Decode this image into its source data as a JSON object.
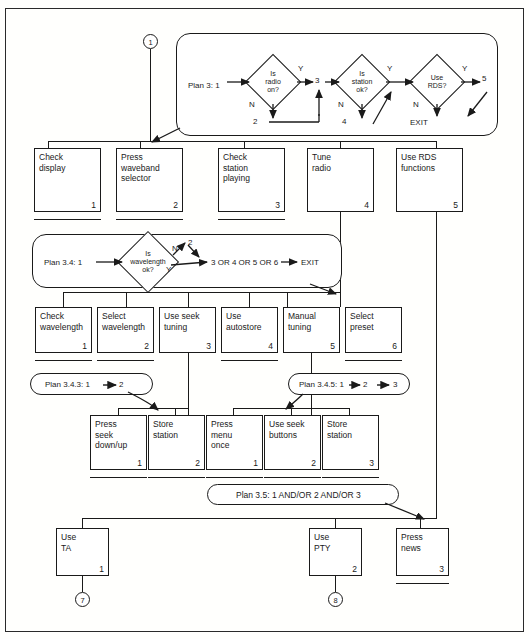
{
  "diagram": {
    "type": "hta-flow"
  },
  "connectors": {
    "top": "1",
    "bottom_left": "7",
    "bottom_right": "8"
  },
  "plan_3": {
    "label": "Plan 3: 1",
    "diamonds": [
      {
        "line1": "Is",
        "line2": "radio",
        "line3": "on?"
      },
      {
        "line1": "Is",
        "line2": "station",
        "line3": "ok?"
      },
      {
        "line1": "Use",
        "line2": "RDS?",
        "line3": ""
      }
    ],
    "labels": {
      "y1": "Y",
      "n1": "N",
      "out1": "3",
      "down1": "2",
      "y2": "Y",
      "n2": "N",
      "down2": "4",
      "y3": "Y",
      "n3": "N",
      "out3": "5",
      "exit": "EXIT"
    }
  },
  "plan_3_4": {
    "label": "Plan 3.4: 1",
    "diamond": {
      "line1": "Is",
      "line2": "wavelength",
      "line3": "ok?"
    },
    "labels": {
      "n": "N",
      "y": "Y",
      "up": "2",
      "result": "3 OR 4 OR 5 OR 6",
      "exit": "EXIT"
    }
  },
  "plan_3_4_3": {
    "label_a": "Plan 3.4.3: 1",
    "label_b": "2"
  },
  "plan_3_4_5": {
    "label_a": "Plan 3.4.5: 1",
    "label_b": "2",
    "label_c": "3"
  },
  "plan_3_5": {
    "label": "Plan  3.5: 1 AND/OR 2 AND/OR 3"
  },
  "row1": [
    {
      "text": "Check\ndisplay",
      "num": "1",
      "underline": true
    },
    {
      "text": "Press\nwaveband\nselector",
      "num": "2",
      "underline": true
    },
    {
      "text": "Check\nstation\nplaying",
      "num": "3",
      "underline": true
    },
    {
      "text": "Tune\nradio",
      "num": "4",
      "underline": false
    },
    {
      "text": "Use RDS\nfunctions",
      "num": "5",
      "underline": false
    }
  ],
  "row2": [
    {
      "text": "Check\nwavelength",
      "num": "1",
      "underline": true
    },
    {
      "text": "Select\nwavelength",
      "num": "2",
      "underline": true
    },
    {
      "text": "Use seek\ntuning",
      "num": "3",
      "underline": false
    },
    {
      "text": "Use\nautostore",
      "num": "4",
      "underline": true
    },
    {
      "text": "Manual\ntuning",
      "num": "5",
      "underline": false
    },
    {
      "text": "Select\npreset",
      "num": "6",
      "underline": true
    }
  ],
  "row3": [
    {
      "text": "Press\nseek\ndown/up",
      "num": "1",
      "underline": true
    },
    {
      "text": "Store\nstation",
      "num": "2",
      "underline": true
    },
    {
      "text": "Press\nmenu\nonce",
      "num": "1",
      "underline": true
    },
    {
      "text": "Use seek\nbuttons",
      "num": "2",
      "underline": true
    },
    {
      "text": "Store\nstation",
      "num": "3",
      "underline": true
    }
  ],
  "row4": [
    {
      "text": "Use\nTA",
      "num": "1",
      "underline": false
    },
    {
      "text": "Use\nPTY",
      "num": "2",
      "underline": false
    },
    {
      "text": "Press\nnews",
      "num": "3",
      "underline": true
    }
  ]
}
